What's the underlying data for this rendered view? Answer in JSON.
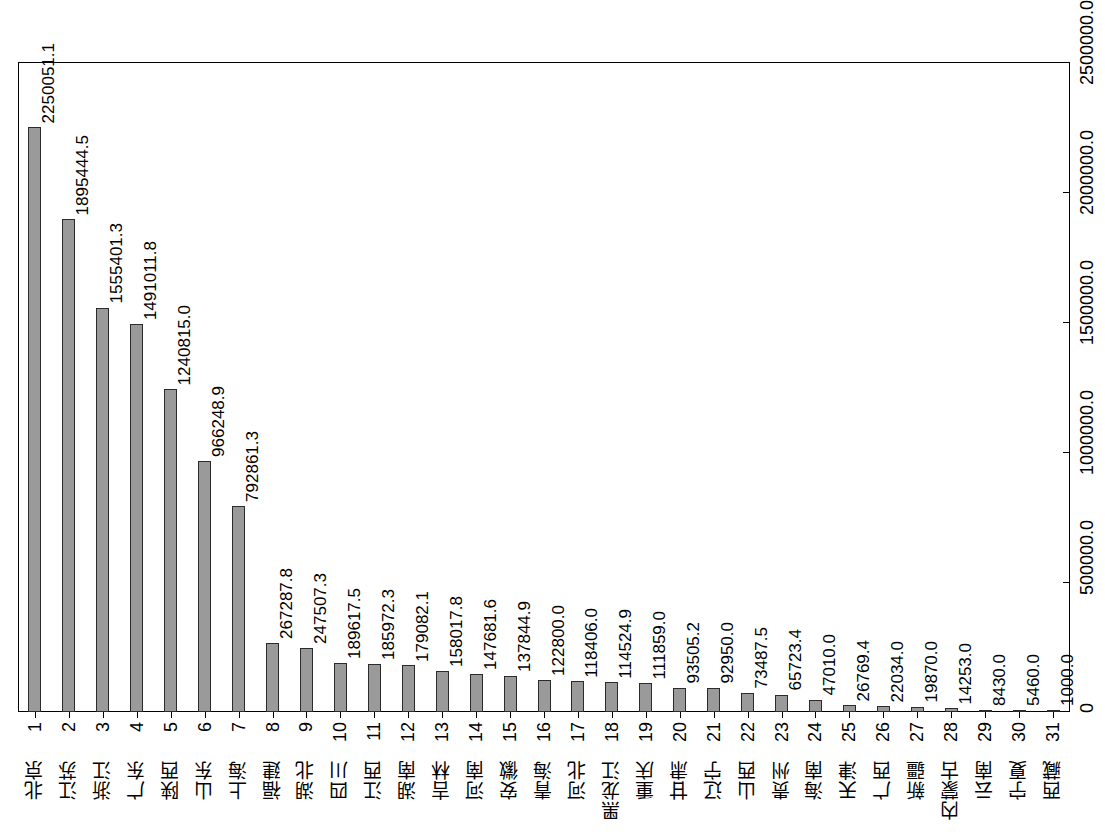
{
  "chart_data": {
    "type": "bar",
    "title": "",
    "subtitle": "",
    "xlabel": "",
    "ylabel": "",
    "orientation": "vertical-bars-rotated-page",
    "grid": false,
    "legend": null,
    "ylim": [
      0,
      2500000
    ],
    "ytick_labels": [
      "0",
      "500000.0",
      "1000000.0",
      "1500000.0",
      "2000000.0",
      "2500000.0"
    ],
    "ytick_values": [
      0,
      500000,
      1000000,
      1500000,
      2000000,
      2500000
    ],
    "categories": [
      "北京",
      "江苏",
      "浙江",
      "广东",
      "陕西",
      "山东",
      "上海",
      "福建",
      "湖北",
      "四川",
      "江西",
      "湖南",
      "吉林",
      "河南",
      "安徽",
      "青海",
      "河北",
      "黑龙江",
      "重庆",
      "甘肃",
      "辽宁",
      "山西",
      "贵州",
      "海南",
      "天津",
      "广西",
      "新疆",
      "内蒙古",
      "云南",
      "宁夏",
      "西藏"
    ],
    "ranks": [
      "1",
      "2",
      "3",
      "4",
      "5",
      "6",
      "7",
      "8",
      "9",
      "10",
      "11",
      "12",
      "13",
      "14",
      "15",
      "16",
      "17",
      "18",
      "19",
      "20",
      "21",
      "22",
      "23",
      "24",
      "25",
      "26",
      "27",
      "28",
      "29",
      "30",
      "31"
    ],
    "values": [
      2250051.1,
      1895444.5,
      1555401.3,
      1491011.8,
      1240815.0,
      966248.9,
      792861.3,
      267287.8,
      247507.3,
      189617.5,
      185972.3,
      179082.1,
      158017.8,
      147681.6,
      137844.9,
      122800.0,
      118406.0,
      114524.9,
      111859.0,
      93505.2,
      92950.0,
      73487.5,
      65723.4,
      47010.0,
      26769.4,
      22034.0,
      19870.0,
      14253.0,
      8430.0,
      5460.0,
      1000.0
    ],
    "value_labels": [
      "2250051.1",
      "1895444.5",
      "1555401.3",
      "1491011.8",
      "1240815.0",
      "966248.9",
      "792861.3",
      "267287.8",
      "247507.3",
      "189617.5",
      "185972.3",
      "179082.1",
      "158017.8",
      "147681.6",
      "137844.9",
      "122800.0",
      "118406.0",
      "114524.9",
      "111859.0",
      "93505.2",
      "92950.0",
      "73487.5",
      "65723.4",
      "47010.0",
      "26769.4",
      "22034.0",
      "19870.0",
      "14253.0",
      "8430.0",
      "5460.0",
      "1000.0"
    ],
    "bar_color": "#9a9a9a",
    "bar_edge_color": "#2b2b2b",
    "background_color": "#ffffff"
  }
}
